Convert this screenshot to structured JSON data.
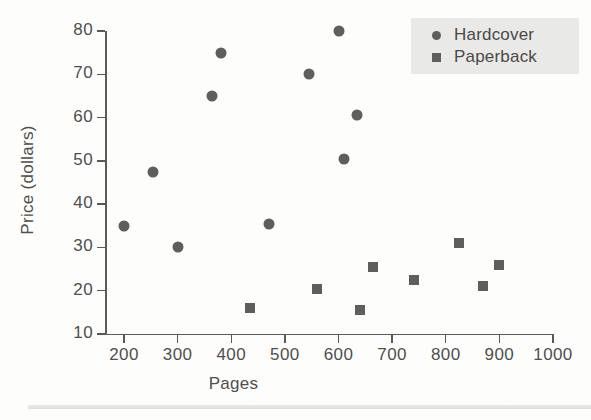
{
  "chart_data": {
    "type": "scatter",
    "title": "",
    "xlabel": "Pages",
    "ylabel": "Price (dollars)",
    "xlim": [
      150,
      1000
    ],
    "ylim": [
      10,
      80
    ],
    "xticks": [
      200,
      300,
      400,
      500,
      600,
      700,
      800,
      900,
      1000
    ],
    "yticks": [
      10,
      20,
      30,
      40,
      50,
      60,
      70,
      80
    ],
    "grid": false,
    "legend_position": "top-right",
    "marker_color": "#5e5e5c",
    "legend_background": "#e9e9e7",
    "series": [
      {
        "name": "Hardcover",
        "marker": "circle",
        "points": [
          {
            "x": 200,
            "y": 35
          },
          {
            "x": 255,
            "y": 47.5
          },
          {
            "x": 300,
            "y": 30
          },
          {
            "x": 365,
            "y": 65
          },
          {
            "x": 380,
            "y": 75
          },
          {
            "x": 470,
            "y": 35.5
          },
          {
            "x": 545,
            "y": 70
          },
          {
            "x": 600,
            "y": 80
          },
          {
            "x": 610,
            "y": 50.5
          },
          {
            "x": 635,
            "y": 60.5
          }
        ]
      },
      {
        "name": "Paperback",
        "marker": "square",
        "points": [
          {
            "x": 435,
            "y": 16
          },
          {
            "x": 560,
            "y": 20.5
          },
          {
            "x": 640,
            "y": 15.5
          },
          {
            "x": 665,
            "y": 25.5
          },
          {
            "x": 740,
            "y": 22.5
          },
          {
            "x": 825,
            "y": 31
          },
          {
            "x": 870,
            "y": 21
          },
          {
            "x": 900,
            "y": 26
          }
        ]
      }
    ]
  },
  "legend": {
    "entries": [
      {
        "label": "Hardcover",
        "marker": "circle"
      },
      {
        "label": "Paperback",
        "marker": "square"
      }
    ]
  }
}
